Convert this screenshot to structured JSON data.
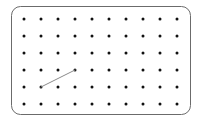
{
  "figure": {
    "name": "geoboard",
    "canvas": {
      "width": 200,
      "height": 121,
      "background": "#ffffff"
    }
  },
  "board": {
    "name": "peg-board",
    "shape": "rounded-rectangle",
    "x": 11,
    "y": 6,
    "width": 179,
    "height": 108,
    "corner_radius": 9,
    "border_color": "#6b6b6b",
    "border_width": 1,
    "fill_color": "#ffffff"
  },
  "pegs": {
    "name": "peg-grid",
    "rows": 6,
    "columns": 10,
    "count": 60,
    "origin_x": 24,
    "origin_y": 19,
    "spacing_x": 17,
    "spacing_y": 17,
    "radius": 1.5,
    "color": "#111111",
    "row_labels": [
      "1",
      "2",
      "3",
      "4",
      "5",
      "6"
    ],
    "column_labels": [
      "1",
      "2",
      "3",
      "4",
      "5",
      "6",
      "7",
      "8",
      "9",
      "10"
    ]
  },
  "bands": {
    "name": "rubber-bands",
    "color": "#8a8a8a",
    "width": 1,
    "segments": [
      {
        "name": "band-segment-1",
        "from": {
          "row": 5,
          "col": 2
        },
        "to": {
          "row": 4,
          "col": 4
        },
        "from_point": {
          "x": 41,
          "y": 87
        },
        "to_point": {
          "x": 75,
          "y": 70
        }
      }
    ]
  }
}
